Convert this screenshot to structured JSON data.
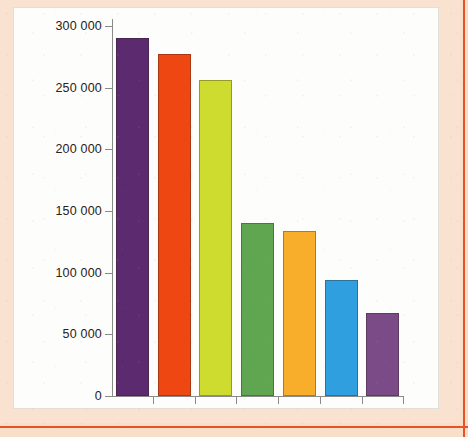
{
  "figure": {
    "panel_background": "#fdfdfb",
    "page_background": "#f9e2cf",
    "border_accent": "#e8522b",
    "axis_color": "#8a8a8a"
  },
  "chart_data": {
    "type": "bar",
    "title": "",
    "subtitle": "",
    "xlabel": "",
    "ylabel": "",
    "categories": [
      "1",
      "2",
      "3",
      "4",
      "5",
      "6",
      "7"
    ],
    "values": [
      290000,
      277000,
      256000,
      140000,
      134000,
      94000,
      67000
    ],
    "colors": [
      "#5c2a6e",
      "#ee4712",
      "#cedc2f",
      "#60a650",
      "#f9ae2b",
      "#2f9fe0",
      "#7b4b87"
    ],
    "ylim": [
      0,
      300000
    ],
    "ytick_values": [
      0,
      50000,
      100000,
      150000,
      200000,
      250000,
      300000
    ],
    "ytick_labels": [
      "0",
      "50 000",
      "100 000",
      "150 000",
      "200 000",
      "250 000",
      "300 000"
    ],
    "grid": false,
    "legend": null,
    "xtick_labels": [
      "",
      "",
      "",
      "",
      "",
      "",
      ""
    ],
    "annotations": []
  }
}
